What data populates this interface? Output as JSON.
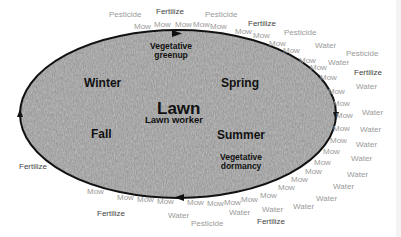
{
  "diagram": {
    "center": {
      "title": "Lawn",
      "subtitle": "Lawn worker"
    },
    "seasons": {
      "winter": "Winter",
      "spring": "Spring",
      "summer": "Summer",
      "fall": "Fall"
    },
    "phases": {
      "top": [
        "Vegetative",
        "greenup"
      ],
      "bottom_right": [
        "Vegetative",
        "dormancy"
      ]
    },
    "colors": {
      "ring": "#111111",
      "grass_fill": "#8f8f8f",
      "activity_text": "#9a9a9a",
      "fertilize_text": "#444444"
    },
    "activities": [
      {
        "t": "Pesticide",
        "x": 109,
        "y": 11,
        "k": "p"
      },
      {
        "t": "Fertilize",
        "x": 156,
        "y": 8,
        "k": "f"
      },
      {
        "t": "Pesticide",
        "x": 205,
        "y": 11,
        "k": "p"
      },
      {
        "t": "Mow",
        "x": 134,
        "y": 23,
        "k": "m"
      },
      {
        "t": "Mow",
        "x": 154,
        "y": 21,
        "k": "m"
      },
      {
        "t": "Mow",
        "x": 175,
        "y": 21,
        "k": "m"
      },
      {
        "t": "Mow",
        "x": 193,
        "y": 21,
        "k": "m"
      },
      {
        "t": "Mow",
        "x": 210,
        "y": 23,
        "k": "m"
      },
      {
        "t": "Fertilize",
        "x": 248,
        "y": 20,
        "k": "f"
      },
      {
        "t": "Mow",
        "x": 235,
        "y": 28,
        "k": "m"
      },
      {
        "t": "Mow",
        "x": 253,
        "y": 32,
        "k": "m"
      },
      {
        "t": "Pesticide",
        "x": 284,
        "y": 29,
        "k": "p"
      },
      {
        "t": "Mow",
        "x": 269,
        "y": 40,
        "k": "m"
      },
      {
        "t": "Mow",
        "x": 283,
        "y": 47,
        "k": "m"
      },
      {
        "t": "Water",
        "x": 315,
        "y": 42,
        "k": "w"
      },
      {
        "t": "Pesticide",
        "x": 346,
        "y": 50,
        "k": "p"
      },
      {
        "t": "Mow",
        "x": 299,
        "y": 57,
        "k": "m"
      },
      {
        "t": "Mow",
        "x": 310,
        "y": 64,
        "k": "m"
      },
      {
        "t": "Water",
        "x": 328,
        "y": 59,
        "k": "w"
      },
      {
        "t": "Fertilize",
        "x": 354,
        "y": 69,
        "k": "f"
      },
      {
        "t": "Mow",
        "x": 320,
        "y": 74,
        "k": "m"
      },
      {
        "t": "Water",
        "x": 356,
        "y": 83,
        "k": "w"
      },
      {
        "t": "Mow",
        "x": 328,
        "y": 88,
        "k": "m"
      },
      {
        "t": "Mow",
        "x": 333,
        "y": 100,
        "k": "m"
      },
      {
        "t": "Water",
        "x": 362,
        "y": 109,
        "k": "w"
      },
      {
        "t": "Mow",
        "x": 336,
        "y": 112,
        "k": "m"
      },
      {
        "t": "Mow",
        "x": 333,
        "y": 125,
        "k": "m"
      },
      {
        "t": "Water",
        "x": 360,
        "y": 126,
        "k": "w"
      },
      {
        "t": "Mow",
        "x": 330,
        "y": 137,
        "k": "m"
      },
      {
        "t": "Water",
        "x": 356,
        "y": 141,
        "k": "w"
      },
      {
        "t": "Mow",
        "x": 323,
        "y": 148,
        "k": "m"
      },
      {
        "t": "Water",
        "x": 351,
        "y": 155,
        "k": "w"
      },
      {
        "t": "Mow",
        "x": 314,
        "y": 159,
        "k": "m"
      },
      {
        "t": "Water",
        "x": 347,
        "y": 171,
        "k": "w"
      },
      {
        "t": "Mow",
        "x": 305,
        "y": 168,
        "k": "m"
      },
      {
        "t": "Water",
        "x": 333,
        "y": 183,
        "k": "w"
      },
      {
        "t": "Mow",
        "x": 291,
        "y": 176,
        "k": "m"
      },
      {
        "t": "Water",
        "x": 316,
        "y": 195,
        "k": "w"
      },
      {
        "t": "Mow",
        "x": 278,
        "y": 184,
        "k": "m"
      },
      {
        "t": "Water",
        "x": 293,
        "y": 203,
        "k": "w"
      },
      {
        "t": "Mow",
        "x": 260,
        "y": 192,
        "k": "m"
      },
      {
        "t": "Water",
        "x": 262,
        "y": 206,
        "k": "w"
      },
      {
        "t": "Mow",
        "x": 241,
        "y": 196,
        "k": "m"
      },
      {
        "t": "Mow",
        "x": 224,
        "y": 199,
        "k": "m"
      },
      {
        "t": "Water",
        "x": 229,
        "y": 209,
        "k": "w"
      },
      {
        "t": "Fertilize",
        "x": 257,
        "y": 218,
        "k": "f"
      },
      {
        "t": "Mow",
        "x": 207,
        "y": 200,
        "k": "m"
      },
      {
        "t": "Mow",
        "x": 187,
        "y": 199,
        "k": "m"
      },
      {
        "t": "Water",
        "x": 168,
        "y": 212,
        "k": "w"
      },
      {
        "t": "Pesticide",
        "x": 191,
        "y": 220,
        "k": "p"
      },
      {
        "t": "Mow",
        "x": 157,
        "y": 198,
        "k": "m"
      },
      {
        "t": "Mow",
        "x": 137,
        "y": 196,
        "k": "m"
      },
      {
        "t": "Mow",
        "x": 117,
        "y": 194,
        "k": "m"
      },
      {
        "t": "Mow",
        "x": 87,
        "y": 188,
        "k": "m"
      },
      {
        "t": "Fertilize",
        "x": 97,
        "y": 210,
        "k": "f"
      },
      {
        "t": "Fertilize",
        "x": 19,
        "y": 163,
        "k": "f"
      }
    ]
  }
}
